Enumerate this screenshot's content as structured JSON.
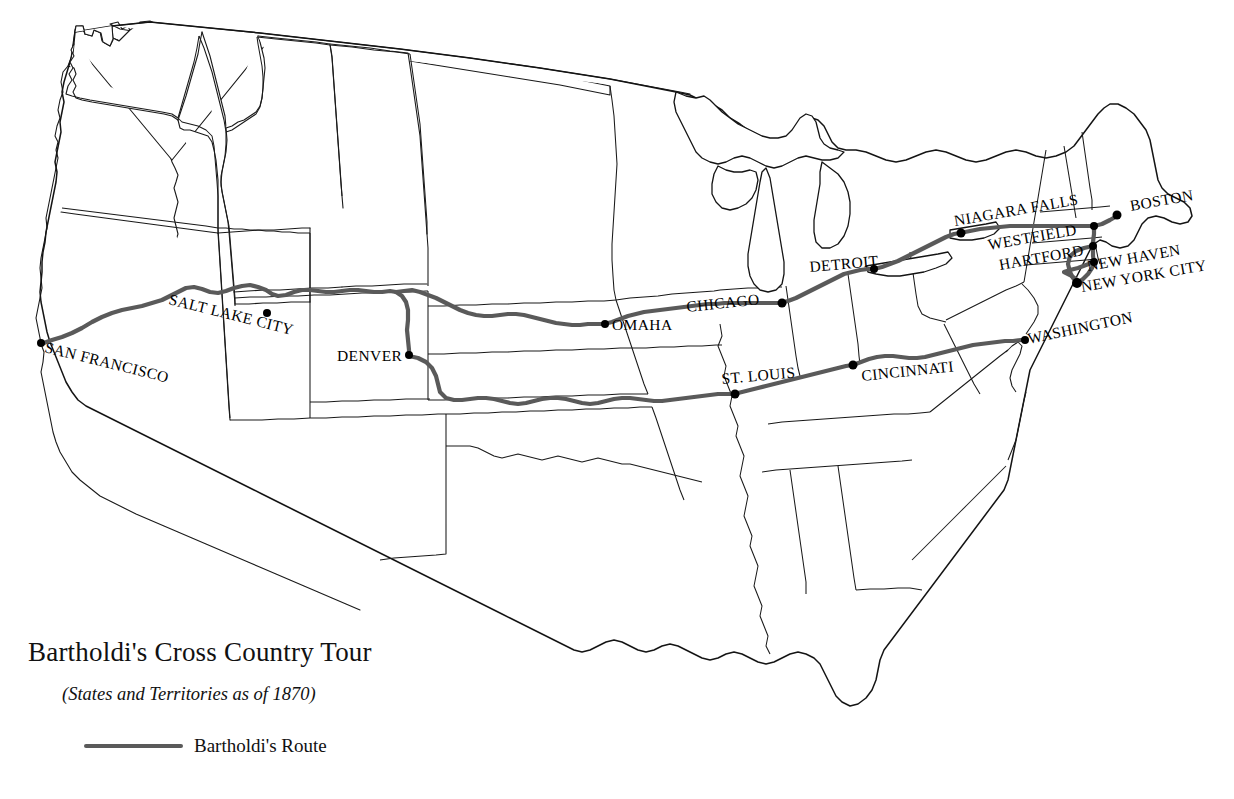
{
  "map": {
    "title": "Bartholdi's Cross Country Tour",
    "subtitle": "(States and Territories as of 1870)",
    "background_color": "#ffffff",
    "border_color": "#1a1a1a",
    "route_color": "#5a5a5a"
  },
  "legend": {
    "route_label": "Bartholdi's Route"
  },
  "cities": [
    {
      "name": "SAN FRANCISCO",
      "label_x": 44,
      "label_y": 352,
      "rotate": 14,
      "dot_x": 41,
      "dot_y": 343,
      "anchor": "start"
    },
    {
      "name": "SALT LAKE CITY",
      "label_x": 168,
      "label_y": 304,
      "rotate": 14,
      "dot_x": 267,
      "dot_y": 313,
      "anchor": "start"
    },
    {
      "name": "DENVER",
      "label_x": 337,
      "label_y": 358,
      "rotate": 0,
      "dot_x": 409,
      "dot_y": 355,
      "anchor": "start"
    },
    {
      "name": "OMAHA",
      "label_x": 612,
      "label_y": 329,
      "rotate": 0,
      "dot_x": 605,
      "dot_y": 324,
      "anchor": "start"
    },
    {
      "name": "CHICAGO",
      "label_x": 687,
      "label_y": 312,
      "rotate": -6,
      "dot_x": 782,
      "dot_y": 303,
      "anchor": "start"
    },
    {
      "name": "ST. LOUIS",
      "label_x": 725,
      "label_y": 382,
      "rotate": -5,
      "dot_x": 735,
      "dot_y": 394,
      "anchor": "start"
    },
    {
      "name": "CINCINNATI",
      "label_x": 862,
      "label_y": 380,
      "rotate": -6,
      "dot_x": 853,
      "dot_y": 365,
      "anchor": "start"
    },
    {
      "name": "DETROIT",
      "label_x": 812,
      "label_y": 272,
      "rotate": -5,
      "dot_x": 874,
      "dot_y": 269,
      "anchor": "start"
    },
    {
      "name": "NIAGARA FALLS",
      "label_x": 955,
      "label_y": 224,
      "rotate": -10,
      "dot_x": 961,
      "dot_y": 233,
      "anchor": "start"
    },
    {
      "name": "BOSTON",
      "label_x": 1133,
      "label_y": 208,
      "rotate": -10,
      "dot_x": 1117,
      "dot_y": 215,
      "anchor": "start"
    },
    {
      "name": "WESTFIELD",
      "label_x": 991,
      "label_y": 247,
      "rotate": -10,
      "dot_x": 1094,
      "dot_y": 226,
      "anchor": "start"
    },
    {
      "name": "HARTFORD",
      "label_x": 1001,
      "label_y": 268,
      "rotate": -10,
      "dot_x": 1093,
      "dot_y": 246,
      "anchor": "start"
    },
    {
      "name": "NEW HAVEN",
      "label_x": 1090,
      "label_y": 269,
      "rotate": -10,
      "dot_x": 1094,
      "dot_y": 262,
      "anchor": "start"
    },
    {
      "name": "NEW YORK CITY",
      "label_x": 1085,
      "label_y": 290,
      "rotate": -10,
      "dot_x": 1077,
      "dot_y": 283,
      "anchor": "start"
    },
    {
      "name": "WASHINGTON",
      "label_x": 1029,
      "label_y": 343,
      "rotate": -12,
      "dot_x": 1025,
      "dot_y": 340,
      "anchor": "start"
    }
  ],
  "route_segments": [
    {
      "name": "san-francisco-to-denver-west"
    },
    {
      "name": "denver-to-omaha-north"
    },
    {
      "name": "omaha-to-chicago"
    },
    {
      "name": "chicago-to-detroit-niagara"
    },
    {
      "name": "niagara-to-boston-newyork"
    },
    {
      "name": "denver-south-to-st-louis"
    },
    {
      "name": "st-louis-to-cincinnati-washington"
    }
  ]
}
